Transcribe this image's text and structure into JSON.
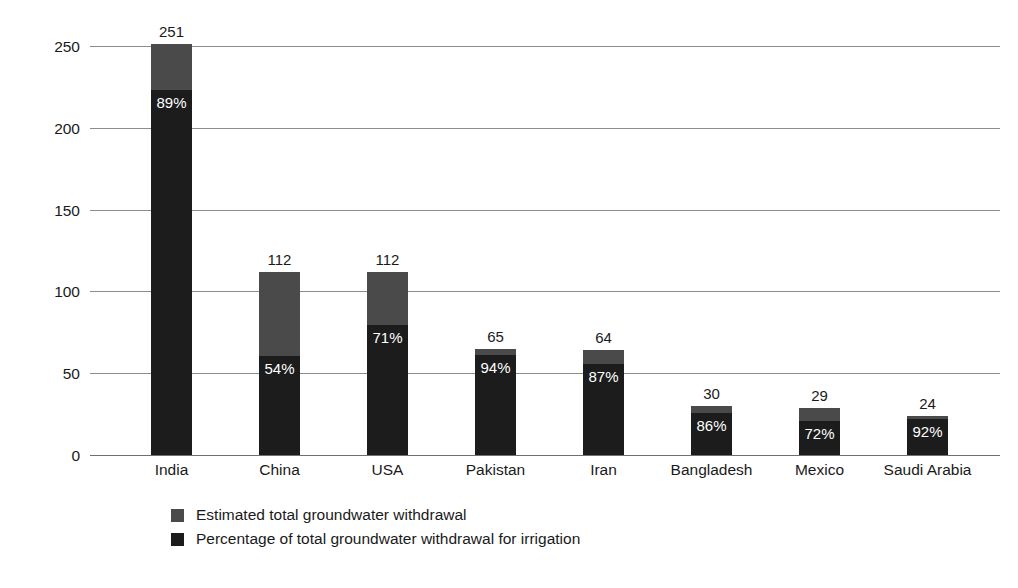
{
  "chart_data": {
    "type": "bar",
    "subtype": "stacked-overlay",
    "title": "",
    "xlabel": "",
    "ylabel": "Estimated total groundwater withdrawal (km3)",
    "ylabel_base": "Estimated total groundwater withdrawal (km",
    "ylabel_sup": "3",
    "ylabel_tail": ")",
    "ylim": [
      0,
      250
    ],
    "ytick_labels": [
      "250",
      "200",
      "150",
      "100",
      "50",
      "0"
    ],
    "ytick_values": [
      250,
      200,
      150,
      100,
      50,
      0
    ],
    "grid": true,
    "legend_position": "bottom-left",
    "categories": [
      "India",
      "China",
      "USA",
      "Pakistan",
      "Iran",
      "Bangladesh",
      "Mexico",
      "Saudi Arabia"
    ],
    "series": [
      {
        "name": "Estimated total groundwater withdrawal",
        "color": "#4a4a4a",
        "values": [
          251,
          112,
          112,
          65,
          64,
          30,
          29,
          24
        ],
        "value_labels": [
          "251",
          "112",
          "112",
          "65",
          "64",
          "30",
          "29",
          "24"
        ]
      },
      {
        "name": "Percentage of total groundwater withdrawal for irrigation",
        "color": "#1c1c1c",
        "values": [
          89,
          54,
          71,
          94,
          87,
          86,
          72,
          92
        ],
        "value_labels": [
          "89%",
          "54%",
          "71%",
          "94%",
          "87%",
          "86%",
          "72%",
          "92%"
        ]
      }
    ],
    "bars": [
      {
        "category": "India",
        "total": 251,
        "total_label": "251",
        "pct": 89,
        "pct_label": "89%"
      },
      {
        "category": "China",
        "total": 112,
        "total_label": "112",
        "pct": 54,
        "pct_label": "54%"
      },
      {
        "category": "USA",
        "total": 112,
        "total_label": "112",
        "pct": 71,
        "pct_label": "71%"
      },
      {
        "category": "Pakistan",
        "total": 65,
        "total_label": "65",
        "pct": 94,
        "pct_label": "94%"
      },
      {
        "category": "Iran",
        "total": 64,
        "total_label": "64",
        "pct": 87,
        "pct_label": "87%"
      },
      {
        "category": "Bangladesh",
        "total": 30,
        "total_label": "30",
        "pct": 86,
        "pct_label": "86%"
      },
      {
        "category": "Mexico",
        "total": 29,
        "total_label": "29",
        "pct": 72,
        "pct_label": "72%"
      },
      {
        "category": "Saudi Arabia",
        "total": 24,
        "total_label": "24",
        "pct": 92,
        "pct_label": "92%"
      }
    ]
  },
  "legend": {
    "items": [
      {
        "label": "Estimated total groundwater withdrawal",
        "color": "#4a4a4a"
      },
      {
        "label": "Percentage of total groundwater withdrawal for irrigation",
        "color": "#1c1c1c"
      }
    ]
  }
}
